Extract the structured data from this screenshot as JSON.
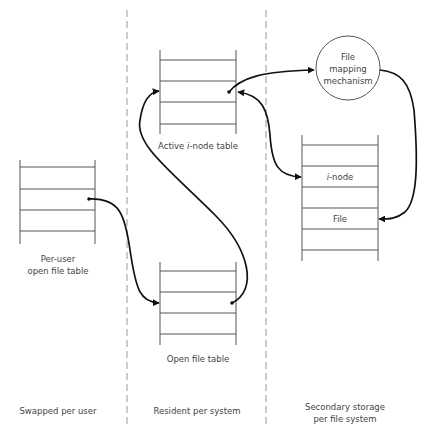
{
  "diagram": {
    "regions": [
      {
        "id": "swapped",
        "label_lines": [
          "Swapped per user"
        ]
      },
      {
        "id": "resident",
        "label_lines": [
          "Resident per system"
        ]
      },
      {
        "id": "secondary",
        "label_lines": [
          "Secondary storage",
          "per file system"
        ]
      }
    ],
    "nodes": {
      "per_user_table": {
        "label_lines": [
          "Per-user",
          "open file table"
        ]
      },
      "active_inode_table": {
        "label_prefix": "Active ",
        "label_italic": "i",
        "label_suffix": "-node table"
      },
      "open_file_table": {
        "label": "Open file table"
      },
      "file_mapping": {
        "label_lines": [
          "File",
          "mapping",
          "mechanism"
        ]
      },
      "secondary_table": {
        "rows": [
          {
            "italic": "",
            "text": ""
          },
          {
            "italic": "i",
            "text": "-node"
          },
          {
            "italic": "",
            "text": ""
          },
          {
            "italic": "",
            "text": "File"
          },
          {
            "italic": "",
            "text": ""
          }
        ]
      }
    },
    "edges": [
      {
        "from": "per_user_table",
        "to": "open_file_table"
      },
      {
        "from": "open_file_table",
        "to": "active_inode_table"
      },
      {
        "from": "active_inode_table",
        "to": "file_mapping"
      },
      {
        "from": "secondary_table.inode",
        "to": "active_inode_table",
        "bidirectional": true
      },
      {
        "from": "file_mapping",
        "to": "secondary_table.file"
      }
    ]
  }
}
